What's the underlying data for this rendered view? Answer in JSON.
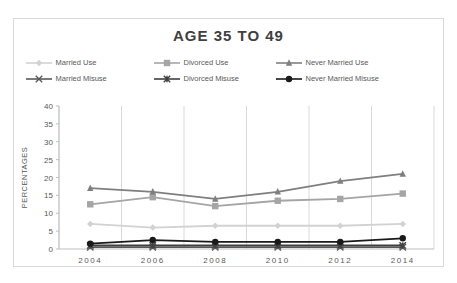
{
  "page": {
    "title": "AGE 35 TO 49"
  },
  "colors": {
    "chart_border": "#d9d9d9",
    "gridline": "#d9d9d9",
    "axis_line": "#bfbfbf",
    "tick_label": "#595959",
    "title_text": "#404040",
    "background": "#ffffff"
  },
  "chart_data": {
    "type": "line",
    "title": "AGE 35 TO 49",
    "xlabel": "",
    "ylabel": "PERCENTAGES",
    "ylim": [
      0,
      40
    ],
    "ytick_step": 5,
    "yticks": [
      0,
      5,
      10,
      15,
      20,
      25,
      30,
      35,
      40
    ],
    "grid": "vertical-only",
    "legend_position": "top",
    "legend_rows": [
      [
        0,
        1,
        2
      ],
      [
        3,
        4,
        5
      ]
    ],
    "categories": [
      "2004",
      "2006",
      "2008",
      "2010",
      "2012",
      "2014"
    ],
    "series": [
      {
        "name": "Married Use",
        "marker": "diamond",
        "color": "#d2d2d2",
        "values": [
          7,
          6,
          6.5,
          6.5,
          6.5,
          7
        ]
      },
      {
        "name": "Divorced Use",
        "marker": "square",
        "color": "#a5a5a5",
        "values": [
          12.5,
          14.5,
          12,
          13.5,
          14,
          15.5
        ]
      },
      {
        "name": "Never Married Use",
        "marker": "triangle",
        "color": "#7f7f7f",
        "values": [
          17,
          16,
          14,
          16,
          19,
          21
        ]
      },
      {
        "name": "Married Misuse",
        "marker": "x",
        "color": "#595959",
        "values": [
          0.5,
          0.5,
          0.5,
          0.5,
          0.5,
          0.5
        ]
      },
      {
        "name": "Divorced Misuse",
        "marker": "star",
        "color": "#404040",
        "values": [
          1,
          1,
          1,
          1,
          1,
          1
        ]
      },
      {
        "name": "Never Married Misuse",
        "marker": "circle",
        "color": "#1a1a1a",
        "values": [
          1.5,
          2.5,
          2,
          2,
          2,
          3
        ]
      }
    ]
  }
}
